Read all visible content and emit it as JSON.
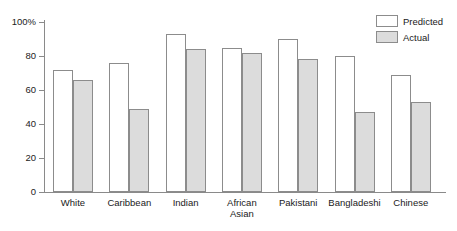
{
  "chart_data": {
    "type": "bar",
    "title": "",
    "xlabel": "",
    "ylabel": "",
    "ylim": [
      0,
      100
    ],
    "yticks": [
      0,
      20,
      40,
      60,
      80,
      100
    ],
    "ytick_labels": [
      "0",
      "20",
      "40",
      "60",
      "80",
      "100%"
    ],
    "grid": false,
    "legend_position": "top-right",
    "categories": [
      "White",
      "Caribbean",
      "Indian",
      "African\nAsian",
      "Pakistani",
      "Bangladeshi",
      "Chinese"
    ],
    "series": [
      {
        "name": "Predicted",
        "color": "#ffffff",
        "values": [
          72,
          76,
          93,
          85,
          90,
          80,
          69
        ]
      },
      {
        "name": "Actual",
        "color": "#dcdcdc",
        "values": [
          66,
          49,
          84,
          82,
          78,
          47,
          53
        ]
      }
    ]
  },
  "legend": {
    "items": [
      {
        "label": "Predicted"
      },
      {
        "label": "Actual"
      }
    ]
  },
  "axis": {
    "y_labels": [
      "100%",
      "80",
      "60",
      "40",
      "20",
      "0"
    ]
  }
}
